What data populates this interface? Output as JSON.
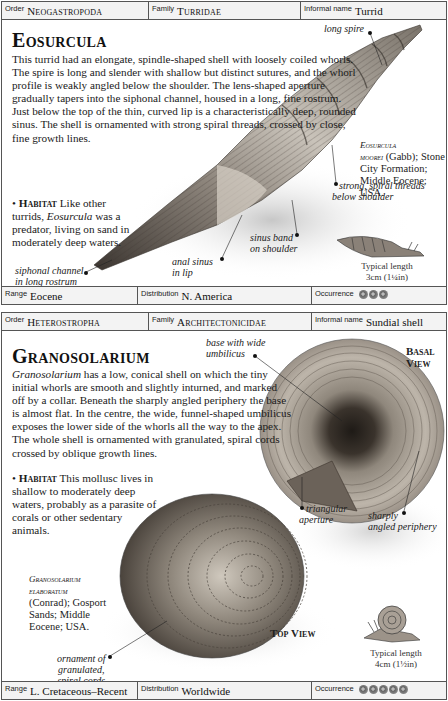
{
  "entries": [
    {
      "header": {
        "order_label": "Order",
        "order": "Neogastropoda",
        "family_label": "Family",
        "family": "Turridae",
        "informal_label": "Informal name",
        "informal": "Turrid"
      },
      "title": "Eosurcula",
      "description": "This turrid had an elongate, spindle-shaped shell with loosely coiled whorls. The spire is long and slender with shallow but distinct sutures, and the whorl profile is weakly angled below the shoulder. The lens-shaped aperture gradually tapers into the siphonal channel, housed in a long, fine rostrum. Just below the top of the thin, curved lip is a characteristically deep, rounded sinus. The shell is ornamented with strong spiral threads, crossed by close, fine growth lines.",
      "habitat": {
        "label": "Habitat",
        "text_pre": " Like other turrids, ",
        "text_italic": "Eosurcula",
        "text_post": " was a predator, living on sand in moderately deep waters."
      },
      "callouts": {
        "long_spire": "long spire",
        "siphonal_1": "siphonal channel",
        "siphonal_2": "in long rostrum",
        "anal_1": "anal sinus",
        "anal_2": "in lip",
        "sinus_1": "sinus band",
        "sinus_2": "on shoulder",
        "spiral_1": "strong, spiral threads",
        "spiral_2": "below shoulder"
      },
      "specimen": {
        "name_1": "Eosurcula",
        "name_2": "moorei",
        "rest": " (Gabb); Stone City Formation; Middle Eocene; USA."
      },
      "typical_length": {
        "label": "Typical length",
        "value": "3cm (1¼in)"
      },
      "footer": {
        "range_label": "Range",
        "range": "Eocene",
        "distribution_label": "Distribution",
        "distribution": "N. America",
        "occurrence_label": "Occurrence",
        "occurrence_count": 3
      }
    },
    {
      "header": {
        "order_label": "Order",
        "order": "Heterostropha",
        "family_label": "Family",
        "family": "Architectonicidae",
        "informal_label": "Informal name",
        "informal": "Sundial shell"
      },
      "title": "Granosolarium",
      "description_italic": "Granosolarium",
      "description": " has a low, conical shell on which the tiny initial whorls are smooth and slightly inturned, and marked off by a collar. Beneath the sharply angled periphery the base is almost flat. In the centre, the wide, funnel-shaped umbilicus exposes the lower side of the whorls all the way to the apex. The whole shell is ornamented with granulated, spiral cords crossed by oblique growth lines.",
      "habitat": {
        "label": "Habitat",
        "text": " This mollusc lives in shallow to moderately deep waters, probably as a parasite of corals or other sedentary animals."
      },
      "callouts": {
        "base_1": "base with wide",
        "base_2": "umbilicus",
        "triangular_1": "triangular",
        "triangular_2": "aperture",
        "sharply_1": "sharply",
        "sharply_2": "angled periphery",
        "ornament_1": "ornament of",
        "ornament_2": "granulated,",
        "ornament_3": "spiral cords"
      },
      "views": {
        "basal_1": "Basal",
        "basal_2": "View",
        "top": "Top View"
      },
      "specimen": {
        "name_1": "Granosolarium",
        "name_2": "elaboratum",
        "rest_1": "(Conrad); Gosport",
        "rest_2": "Sands; Middle",
        "rest_3": "Eocene; USA."
      },
      "typical_length": {
        "label": "Typical length",
        "value": "4cm (1½in)"
      },
      "footer": {
        "range_label": "Range",
        "range": "L. Cretaceous–Recent",
        "distribution_label": "Distribution",
        "distribution": "Worldwide",
        "occurrence_label": "Occurrence",
        "occurrence_count": 5
      }
    }
  ]
}
